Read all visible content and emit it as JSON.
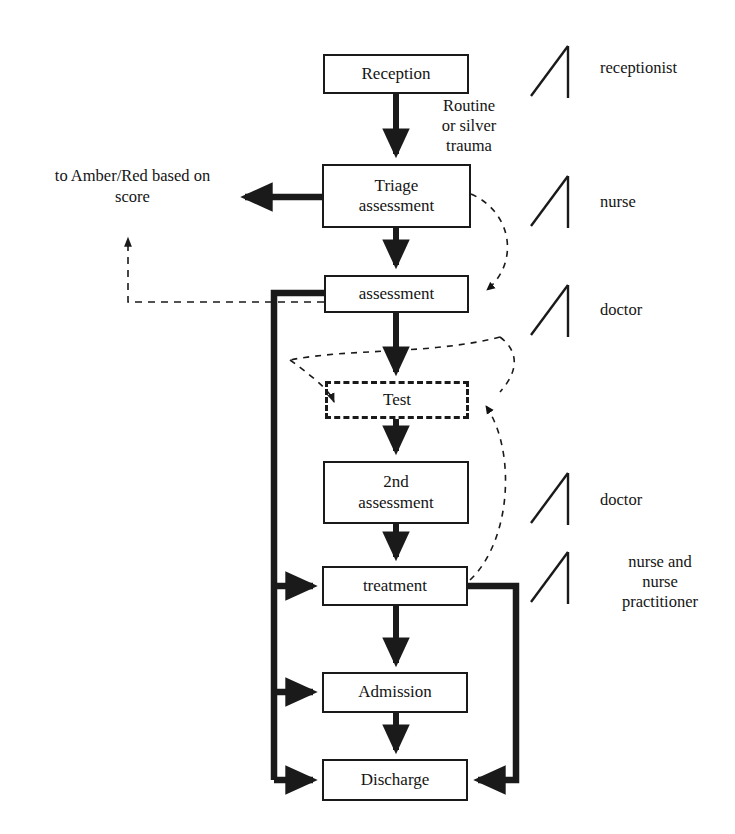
{
  "diagram": {
    "nodes": [
      {
        "id": "reception",
        "label": "Reception",
        "x": 323,
        "y": 54,
        "w": 146,
        "h": 40,
        "style": "solid"
      },
      {
        "id": "triage",
        "label": "Triage\nassessment",
        "x": 322,
        "y": 164,
        "w": 149,
        "h": 64,
        "style": "solid"
      },
      {
        "id": "assessment",
        "label": "assessment",
        "x": 324,
        "y": 275,
        "w": 145,
        "h": 38,
        "style": "solid"
      },
      {
        "id": "test",
        "label": "Test",
        "x": 325,
        "y": 381,
        "w": 144,
        "h": 38,
        "style": "dashed"
      },
      {
        "id": "second",
        "label": "2nd\nassessment",
        "x": 323,
        "y": 461,
        "w": 146,
        "h": 63,
        "style": "solid"
      },
      {
        "id": "treatment",
        "label": "treatment",
        "x": 322,
        "y": 566,
        "w": 146,
        "h": 40,
        "style": "solid"
      },
      {
        "id": "admission",
        "label": "Admission",
        "x": 322,
        "y": 672,
        "w": 146,
        "h": 41,
        "style": "solid"
      },
      {
        "id": "discharge",
        "label": "Discharge",
        "x": 322,
        "y": 759,
        "w": 146,
        "h": 42,
        "style": "solid"
      }
    ],
    "edge_labels": [
      {
        "id": "routine-trauma",
        "text": "Routine\nor silver\ntrauma",
        "x": 414,
        "y": 96,
        "w": 110
      }
    ],
    "notes": [
      {
        "id": "amber-red",
        "text": "to Amber/Red based on\nscore",
        "x": 20,
        "y": 166,
        "w": 225
      }
    ],
    "roles": [
      {
        "id": "role-receptionist",
        "label": "receptionist",
        "marker_x": 530,
        "marker_y": 46,
        "text_x": 600,
        "text_y": 58
      },
      {
        "id": "role-nurse",
        "label": "nurse",
        "marker_x": 530,
        "marker_y": 176,
        "text_x": 600,
        "text_y": 192
      },
      {
        "id": "role-doctor-1",
        "label": "doctor",
        "marker_x": 530,
        "marker_y": 285,
        "text_x": 600,
        "text_y": 300
      },
      {
        "id": "role-doctor-2",
        "label": "doctor",
        "marker_x": 530,
        "marker_y": 473,
        "text_x": 600,
        "text_y": 490
      },
      {
        "id": "role-nurse-np",
        "label": "nurse and\nnurse\npractitioner",
        "marker_x": 530,
        "marker_y": 552,
        "text_x": 598,
        "text_y": 552
      }
    ],
    "colors": {
      "stroke": "#1a1a1a",
      "background": "#ffffff",
      "text": "#141414"
    }
  }
}
